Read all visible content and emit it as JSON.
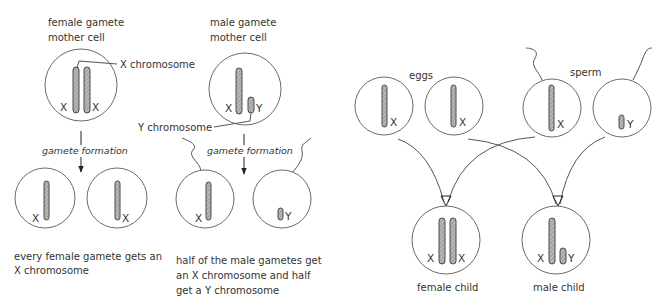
{
  "left_panel": {
    "female_mother_cell": {
      "label_line1": "female gamete",
      "label_line2": "mother cell",
      "chromosomes": [
        "X",
        "X"
      ]
    },
    "male_mother_cell": {
      "label_line1": "male gamete",
      "label_line2": "mother cell",
      "chromosomes": [
        "X",
        "Y"
      ]
    },
    "x_chromosome_callout": "X chromosome",
    "y_chromosome_callout": "Y chromosome",
    "gamete_formation_label": "gamete formation",
    "female_gametes": [
      {
        "chromosome": "X"
      },
      {
        "chromosome": "X"
      }
    ],
    "male_gametes": [
      {
        "chromosome": "X"
      },
      {
        "chromosome": "Y"
      }
    ],
    "female_caption_line1": "every female gamete gets an",
    "female_caption_line2": "X chromosome",
    "male_caption_line1": "half of the male gametes get",
    "male_caption_line2": "an X chromosome and half",
    "male_caption_line3": "get a Y chromosome"
  },
  "right_panel": {
    "eggs_label": "eggs",
    "sperm_label": "sperm",
    "eggs": [
      {
        "chromosome": "X"
      },
      {
        "chromosome": "X"
      }
    ],
    "sperm": [
      {
        "chromosome": "X"
      },
      {
        "chromosome": "Y"
      }
    ],
    "female_child": {
      "label": "female child",
      "chromosomes": [
        "X",
        "X"
      ]
    },
    "male_child": {
      "label": "male child",
      "chromosomes": [
        "X",
        "Y"
      ]
    }
  },
  "colors": {
    "cell_stroke": "#6b6b6b",
    "chromosome_fill": "#a8a8a8",
    "text": "#333333"
  }
}
